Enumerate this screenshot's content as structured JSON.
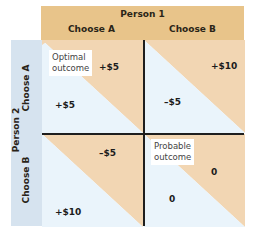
{
  "header": {
    "title": "Person 1",
    "columns": [
      "Choose A",
      "Choose B"
    ]
  },
  "side": {
    "title": "Person 2",
    "rows": [
      "Choose A",
      "Choose B"
    ]
  },
  "colors": {
    "person1": "#e8c48a",
    "person1_cell": "#f2d6b3",
    "person2": "#d6e3ef",
    "person2_cell": "#eaf4fb",
    "lines": "#1e1e1e"
  },
  "cells": [
    {
      "row": "Choose A",
      "col": "Choose A",
      "person1_payoff": "+$5",
      "person2_payoff": "+$5",
      "note": "Optimal outcome"
    },
    {
      "row": "Choose A",
      "col": "Choose B",
      "person1_payoff": "+$10",
      "person2_payoff": "–$5",
      "note": ""
    },
    {
      "row": "Choose B",
      "col": "Choose A",
      "person1_payoff": "–$5",
      "person2_payoff": "+$10",
      "note": ""
    },
    {
      "row": "Choose B",
      "col": "Choose B",
      "person1_payoff": "0",
      "person2_payoff": "0",
      "note": "Probable outcome"
    }
  ],
  "notes": {
    "optimal_line1": "Optimal",
    "optimal_line2": "outcome",
    "probable_line1": "Probable",
    "probable_line2": "outcome"
  }
}
